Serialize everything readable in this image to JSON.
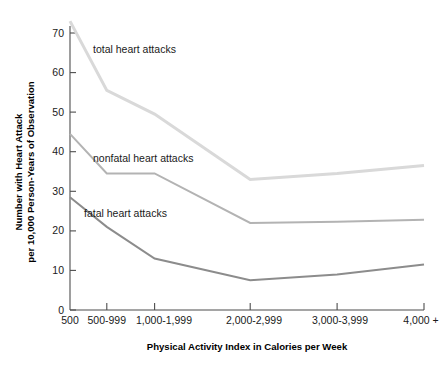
{
  "chart_data": {
    "type": "line",
    "title": "",
    "xlabel": "Physical Activity Index in Calories per Week",
    "ylabel_line1": "Number with Heart Attack",
    "ylabel_line2": "per 10,000 Person-Years of Observation",
    "categories": [
      "500",
      "500-999",
      "1,000-1,999",
      "2,000-2,999",
      "3,000-3,999",
      "4,000 +"
    ],
    "ylim": [
      0,
      75
    ],
    "yticks": [
      0,
      10,
      20,
      30,
      40,
      50,
      60,
      70
    ],
    "ytick_labels": [
      "0",
      "10",
      "20",
      "30",
      "40",
      "50",
      "60",
      "70"
    ],
    "grid": false,
    "legend_position": "inline-labels",
    "series": [
      {
        "name": "total heart attacks",
        "label": "total heart attacks",
        "color": "#d9d9d9",
        "values": [
          73.0,
          55.5,
          49.5,
          33.0,
          34.5,
          36.5
        ]
      },
      {
        "name": "nonfatal heart attacks",
        "label": "nonfatal heart attacks",
        "color": "#b3b3b3",
        "values": [
          44.5,
          34.5,
          34.5,
          22.0,
          22.3,
          22.8
        ]
      },
      {
        "name": "fatal heart attacks",
        "label": "fatal heart attacks",
        "color": "#8c8c8c",
        "values": [
          28.5,
          21.0,
          13.0,
          7.5,
          9.0,
          11.5
        ]
      }
    ],
    "annotations": [
      {
        "text": "total heart attacks",
        "x_px": 93,
        "y_px": 53
      },
      {
        "text": "nonfatal heart attacks",
        "x_px": 93,
        "y_px": 162
      },
      {
        "text": "fatal heart attacks",
        "x_px": 84,
        "y_px": 217
      }
    ]
  }
}
